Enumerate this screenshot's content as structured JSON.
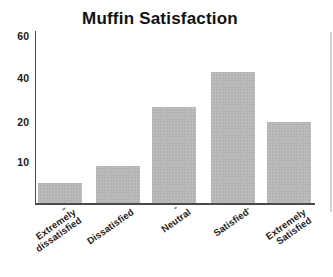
{
  "chart_data": {
    "type": "bar",
    "title": "Muffin Satisfaction",
    "categories": [
      "Extremely dissatisfied",
      "Dissatisfied",
      "Neutral",
      "Satisfied",
      "Extremely Satisfied"
    ],
    "values": [
      5,
      9,
      27,
      43,
      20
    ],
    "xlabel": "",
    "ylabel": "",
    "y_ticks": [
      10,
      20,
      40,
      60
    ],
    "y_tick_labels": [
      "10",
      "20",
      "40",
      "60"
    ],
    "axis_note": "y ticks 10, 20, 40, 60 are equally spaced (non-linear scale), baseline is 0",
    "grid": false,
    "legend": false,
    "layout": {
      "plot": {
        "left": 34.5,
        "top": 31,
        "width": 279,
        "height": 172
      },
      "scale_points": [
        [
          0,
          0
        ],
        [
          10,
          41
        ],
        [
          20,
          81
        ],
        [
          40,
          125
        ],
        [
          60,
          167
        ]
      ],
      "bar_width": 44,
      "bar_centers_px": [
        24,
        82,
        138.5,
        197,
        253.5
      ],
      "category_lines": [
        [
          "Extremely",
          "dissatisfied"
        ],
        [
          "Dissatisfied"
        ],
        [
          "Neutral"
        ],
        [
          "Satisfied"
        ],
        [
          "Extremely",
          "Satisfied"
        ]
      ],
      "label_rotation_deg": -35,
      "label_top_px": 207,
      "label_right_offset_px": 12,
      "colors": {
        "bar": "#b5b5b5",
        "axis": "#4a4a4a",
        "text": "#1c1c1c",
        "title": "#111111",
        "scan_edge": "#cbcbcb",
        "background": "#ffffff"
      },
      "artifacts": {
        "edge_line": {
          "left": 330,
          "top": 32,
          "width": 2,
          "height": 180
        },
        "specks": [
          [
            62,
            208,
            4,
            2
          ],
          [
            174,
            207,
            3,
            2
          ],
          [
            246,
            208,
            3,
            2
          ]
        ]
      }
    }
  }
}
